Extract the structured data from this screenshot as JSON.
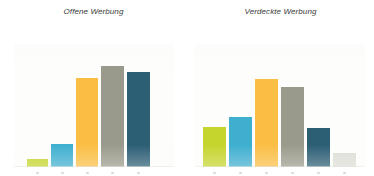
{
  "figure": {
    "background_color": "#ffffff",
    "panel_gap_px": 0
  },
  "chart_data": [
    {
      "type": "bar",
      "title": "Offene Werbung",
      "xlabel": "",
      "ylabel": "",
      "grid": false,
      "legend": "none",
      "ylim": [
        0,
        110
      ],
      "categories": [
        "1",
        "2",
        "3",
        "4",
        "5"
      ],
      "values": [
        7,
        24,
        96,
        110,
        103
      ],
      "colors": [
        "#c6d52e",
        "#3fafd0",
        "#fbbe45",
        "#9a9a8c",
        "#2c5e74"
      ]
    },
    {
      "type": "bar",
      "title": "Verdeckte Werbung",
      "xlabel": "",
      "ylabel": "",
      "grid": false,
      "legend": "none",
      "ylim": [
        0,
        110
      ],
      "categories": [
        "1",
        "2",
        "3",
        "4",
        "5",
        "6"
      ],
      "values": [
        43,
        54,
        96,
        87,
        42,
        14
      ],
      "colors": [
        "#c6d52e",
        "#3fafd0",
        "#fbbe45",
        "#9a9a8c",
        "#2c5e74",
        "#dedeD8"
      ]
    }
  ],
  "panels": [
    {
      "title": "Offene Werbung",
      "bars": [
        {
          "name": "bar-1",
          "color": "#c6d52e",
          "left_px": 13,
          "width_px": 21,
          "height_px": 8
        },
        {
          "name": "bar-2",
          "color": "#3fafd0",
          "left_px": 37,
          "width_px": 22,
          "height_px": 23
        },
        {
          "name": "bar-3",
          "color": "#fbbe45",
          "left_px": 62,
          "width_px": 22,
          "height_px": 89
        },
        {
          "name": "bar-4",
          "color": "#9a9a8c",
          "left_px": 87,
          "width_px": 23,
          "height_px": 101
        },
        {
          "name": "bar-5",
          "color": "#2c5e74",
          "left_px": 113,
          "width_px": 23,
          "height_px": 95
        }
      ]
    },
    {
      "title": "Verdeckte Werbung",
      "bars": [
        {
          "name": "bar-1",
          "color": "#c6d52e",
          "left_px": 8,
          "width_px": 23,
          "height_px": 40
        },
        {
          "name": "bar-2",
          "color": "#3fafd0",
          "left_px": 34,
          "width_px": 23,
          "height_px": 50
        },
        {
          "name": "bar-3",
          "color": "#fbbe45",
          "left_px": 60,
          "width_px": 23,
          "height_px": 88
        },
        {
          "name": "bar-4",
          "color": "#9a9a8c",
          "left_px": 86,
          "width_px": 23,
          "height_px": 80
        },
        {
          "name": "bar-5",
          "color": "#2c5e74",
          "left_px": 112,
          "width_px": 23,
          "height_px": 39
        },
        {
          "name": "bar-6",
          "color": "#dedeD8",
          "left_px": 138,
          "width_px": 23,
          "height_px": 14
        }
      ]
    }
  ]
}
